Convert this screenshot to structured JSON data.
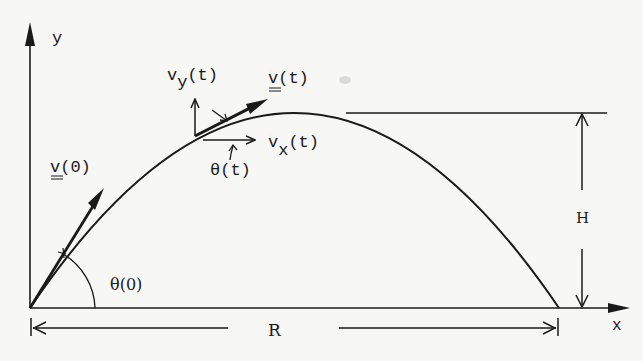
{
  "diagram": {
    "type": "projectile-motion",
    "colors": {
      "background": "#f7f7f5",
      "ink": "#1a1a1a"
    },
    "axes": {
      "x_label": "x",
      "y_label": "y"
    },
    "labels": {
      "initial_velocity": "v(0)",
      "velocity": "v(t)",
      "vy_main": "v",
      "vy_sub": "y",
      "vy_arg": "(t)",
      "vx_main": "v",
      "vx_sub": "x",
      "vx_arg": "(t)",
      "theta_t": "θ(t)",
      "theta_0": "θ(0)",
      "max_height": "H",
      "range": "R"
    }
  }
}
